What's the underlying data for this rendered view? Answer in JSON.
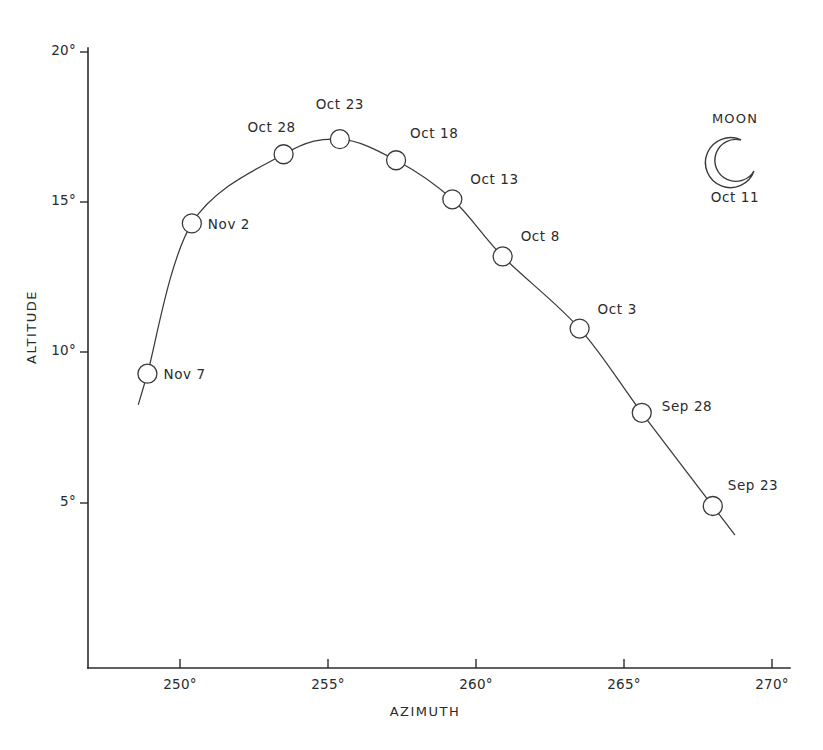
{
  "chart_data": {
    "type": "line",
    "title": "",
    "xlabel": "AZIMUTH",
    "ylabel": "ALTITUDE",
    "xlim": [
      248.0,
      270.6
    ],
    "ylim": [
      3.0,
      20.5
    ],
    "grid": false,
    "legend": "none",
    "x_tick_labels": [
      "250°",
      "255°",
      "260°",
      "265°",
      "270°"
    ],
    "x_tick_values": [
      250,
      255,
      260,
      265,
      270
    ],
    "y_tick_labels": [
      "20°",
      "15°",
      "10°",
      "5°"
    ],
    "y_tick_values": [
      20,
      15,
      10,
      5
    ],
    "series": [
      {
        "name": "Moon path",
        "point_labels": [
          "Sep 23",
          "Sep 28",
          "Oct 3",
          "Oct 8",
          "Oct 13",
          "Oct 18",
          "Oct 23",
          "Oct 28",
          "Nov 2",
          "Nov 7"
        ],
        "x": [
          268.0,
          265.6,
          263.5,
          260.9,
          259.2,
          257.3,
          255.4,
          253.5,
          250.4,
          248.9
        ],
        "y": [
          4.9,
          8.0,
          10.8,
          13.2,
          15.1,
          16.4,
          17.1,
          16.6,
          14.3,
          9.3
        ]
      }
    ],
    "annotations": [
      {
        "name": "moon-legend",
        "title": "MOON",
        "date": "Oct 11",
        "icon": "crescent-moon-icon"
      }
    ]
  },
  "labels": {
    "axis_x_title": "AZIMUTH",
    "axis_y_title": "ALTITUDE",
    "x_ticks": [
      "250°",
      "255°",
      "260°",
      "265°",
      "270°"
    ],
    "y_ticks": [
      "20°",
      "15°",
      "10°",
      "5°"
    ],
    "points": [
      "Sep 23",
      "Sep 28",
      "Oct 3",
      "Oct 8",
      "Oct 13",
      "Oct 18",
      "Oct 23",
      "Oct 28",
      "Nov 2",
      "Nov 7"
    ],
    "moon_title": "MOON",
    "moon_date": "Oct 11"
  },
  "colors": {
    "ink": "#2b2b2b",
    "curve": "#3a3a3a",
    "background": "#ffffff"
  }
}
